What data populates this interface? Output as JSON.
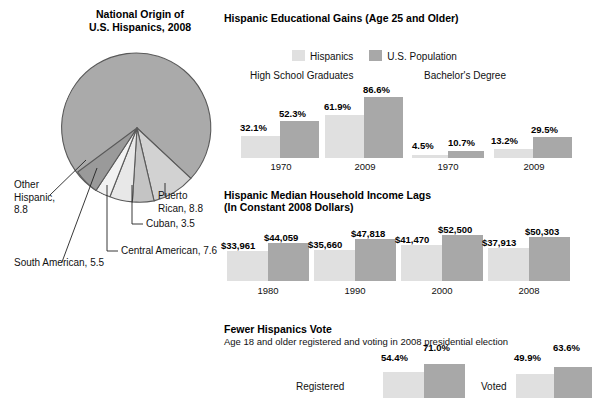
{
  "colors": {
    "hispanic_bar": "#e0e0e0",
    "us_population_bar": "#a8a8a8",
    "pie_mexican": "#a8a8a8",
    "pie_outline": "#555555",
    "text": "#111111"
  },
  "pie_section": {
    "title_line1": "National Origin of",
    "title_line2": "U.S. Hispanics, 2008",
    "center_label": "Mexican, 65.8",
    "labels": {
      "other_hispanic": "Other\nHispanic,\n8.8",
      "other_hispanic_l1": "Other",
      "other_hispanic_l2": "Hispanic,",
      "other_hispanic_l3": "8.8",
      "south_american": "South American, 5.5",
      "central_american": "Central American, 7.6",
      "cuban": "Cuban, 3.5",
      "puerto_rican_l1": "Puerto",
      "puerto_rican_l2": "Rican, 8.8"
    }
  },
  "chart_data": [
    {
      "type": "pie",
      "title": "National Origin of U.S. Hispanics, 2008",
      "categories": [
        "Mexican",
        "Puerto Rican",
        "Cuban",
        "Central American",
        "South American",
        "Other Hispanic"
      ],
      "values": [
        65.8,
        8.8,
        3.5,
        7.6,
        5.5,
        8.8
      ],
      "units": "percent",
      "legend": "labels-with-leader-lines"
    },
    {
      "type": "bar",
      "title": "Hispanic Educational Gains (Age 25 and Older)",
      "legend": [
        "Hispanics",
        "U.S. Population"
      ],
      "panels": [
        {
          "label": "High School Graduates",
          "categories": [
            "1970",
            "2009"
          ],
          "series": [
            {
              "name": "Hispanics",
              "values": [
                32.1,
                61.9
              ],
              "labels": [
                "32.1%",
                "61.9%"
              ]
            },
            {
              "name": "U.S. Population",
              "values": [
                52.3,
                86.6
              ],
              "labels": [
                "52.3%",
                "86.6%"
              ]
            }
          ]
        },
        {
          "label": "Bachelor's Degree",
          "categories": [
            "1970",
            "2009"
          ],
          "series": [
            {
              "name": "Hispanics",
              "values": [
                4.5,
                13.2
              ],
              "labels": [
                "4.5%",
                "13.2%"
              ]
            },
            {
              "name": "U.S. Population",
              "values": [
                10.7,
                29.5
              ],
              "labels": [
                "10.7%",
                "29.5%"
              ]
            }
          ]
        }
      ],
      "ylabel": "percent",
      "ylim": [
        0,
        100
      ]
    },
    {
      "type": "bar",
      "title": "Hispanic Median Household Income Lags",
      "subtitle": "(In Constant 2008 Dollars)",
      "categories": [
        "1980",
        "1990",
        "2000",
        "2008"
      ],
      "series": [
        {
          "name": "Hispanics",
          "values": [
            33961,
            35660,
            41470,
            37913
          ],
          "labels": [
            "$33,961",
            "$35,660",
            "$41,470",
            "$37,913"
          ]
        },
        {
          "name": "U.S. Population",
          "values": [
            44059,
            47818,
            52500,
            50303
          ],
          "labels": [
            "$44,059",
            "$47,818",
            "$52,500",
            "$50,303"
          ]
        }
      ],
      "ylabel": "2008 dollars",
      "ylim": [
        0,
        55000
      ]
    },
    {
      "type": "bar",
      "title": "Fewer Hispanics Vote",
      "subtitle": "Age 18 and older registered and voting in 2008 presidential election",
      "categories": [
        "Registered",
        "Voted"
      ],
      "series": [
        {
          "name": "Hispanics",
          "values": [
            54.4,
            49.9
          ],
          "labels": [
            "54.4%",
            "49.9%"
          ]
        },
        {
          "name": "U.S. Population",
          "values": [
            71.0,
            63.6
          ],
          "labels": [
            "71.0%",
            "63.6%"
          ]
        }
      ],
      "ylabel": "percent",
      "ylim": [
        0,
        100
      ]
    }
  ],
  "edu": {
    "title": "Hispanic Educational Gains (Age 25 and Older)",
    "legend_hispanics": "Hispanics",
    "legend_us": "U.S. Population",
    "panel_hs": "High School Graduates",
    "panel_ba": "Bachelor's Degree",
    "hs": {
      "y1970": "1970",
      "y2009": "2009",
      "h1970": "32.1%",
      "u1970": "52.3%",
      "h2009": "61.9%",
      "u2009": "86.6%"
    },
    "ba": {
      "y1970": "1970",
      "y2009": "2009",
      "h1970": "4.5%",
      "u1970": "10.7%",
      "h2009": "13.2%",
      "u2009": "29.5%"
    }
  },
  "income": {
    "title": "Hispanic Median Household Income Lags",
    "subtitle": "(In Constant 2008 Dollars)",
    "years": [
      "1980",
      "1990",
      "2000",
      "2008"
    ],
    "hispanic_labels": [
      "$33,961",
      "$35,660",
      "$41,470",
      "$37,913"
    ],
    "us_labels": [
      "$44,059",
      "$47,818",
      "$52,500",
      "$50,303"
    ]
  },
  "vote": {
    "title": "Fewer Hispanics Vote",
    "subtitle": "Age 18 and older registered and voting in 2008 presidential election",
    "registered_label": "Registered",
    "voted_label": "Voted",
    "registered_h": "54.4%",
    "registered_u": "71.0%",
    "voted_h": "49.9%",
    "voted_u": "63.6%"
  }
}
